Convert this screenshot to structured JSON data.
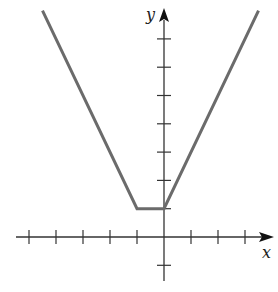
{
  "chart_data": {
    "type": "line",
    "title": "",
    "xlabel": "x",
    "ylabel": "y",
    "grid": false,
    "x_ticks": [
      -5,
      -4,
      -3,
      -2,
      -1,
      0,
      1,
      2,
      3
    ],
    "y_ticks": [
      -1,
      1,
      2,
      3,
      4,
      5,
      6,
      7
    ],
    "series": [
      {
        "name": "f(x)",
        "points": [
          [
            -4.5,
            8
          ],
          [
            -1,
            1
          ],
          [
            0,
            1
          ],
          [
            3.5,
            8
          ]
        ]
      }
    ],
    "xlim": [
      -5.5,
      3.9
    ],
    "ylim": [
      -1.5,
      8.1
    ]
  },
  "labels": {
    "x": "x",
    "y": "y"
  },
  "colors": {
    "curve": "#6b6b6b",
    "axis": "#333333"
  }
}
